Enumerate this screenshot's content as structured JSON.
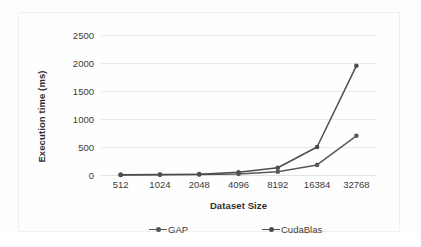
{
  "chart_data": {
    "type": "line",
    "title": "",
    "xlabel": "Dataset Size",
    "ylabel": "Execution time (ms)",
    "categories": [
      "512",
      "1024",
      "2048",
      "4096",
      "8192",
      "16384",
      "32768"
    ],
    "series": [
      {
        "name": "GAP",
        "color": "#595959",
        "values": [
          2,
          5,
          10,
          20,
          60,
          180,
          700
        ]
      },
      {
        "name": "CudaBlas",
        "color": "#4d4d4d",
        "values": [
          3,
          8,
          15,
          50,
          130,
          500,
          1950
        ]
      }
    ],
    "ylim": [
      0,
      2500
    ],
    "ytick_labels": [
      "0",
      "500",
      "1000",
      "1500",
      "2000",
      "2500"
    ],
    "ytick_values": [
      0,
      500,
      1000,
      1500,
      2000,
      2500
    ],
    "grid": true,
    "grid_axis": "y",
    "legend_position": "bottom",
    "marker": "circle",
    "gridline_color": "#eaeaea",
    "text_color": "#3a3a3a",
    "plot_background": "#fefefe"
  },
  "legend": {
    "items": [
      {
        "label": "GAP",
        "color": "#595959"
      },
      {
        "label": "CudaBlas",
        "color": "#4d4d4d"
      }
    ]
  },
  "axes": {
    "y_title": "Execution time (ms)",
    "x_title": "Dataset Size"
  }
}
